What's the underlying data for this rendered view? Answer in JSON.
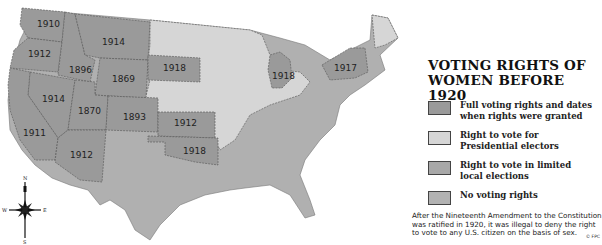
{
  "title_line1": "VOTING RIGHTS OF",
  "title_line2": "WOMEN BEFORE 1920",
  "legend": [
    {
      "label": "Full voting rights and dates when rights were granted",
      "color": "#9a9a9a"
    },
    {
      "label": "Right to vote for Presidential electors",
      "color": "#d6d6d6"
    },
    {
      "label": "Right to vote in limited local elections",
      "color": "#a8a8a8"
    },
    {
      "label": "No voting rights",
      "color": "#b2b2b2"
    }
  ],
  "note": "After the Nineteenth Amendment to the Constitution was ratified in 1920, it was illegal to deny the right to vote to any U.S. citizen on the basis of sex.",
  "credit": "© FPC",
  "compass": {
    "n": "N",
    "s": "S",
    "e": "E",
    "w": "W"
  },
  "states_full_rights": [
    {
      "state": "Washington",
      "year": "1910"
    },
    {
      "state": "Oregon",
      "year": "1912"
    },
    {
      "state": "Idaho",
      "year": "1896"
    },
    {
      "state": "Montana",
      "year": "1914"
    },
    {
      "state": "Wyoming",
      "year": "1869"
    },
    {
      "state": "South Dakota",
      "year": "1918"
    },
    {
      "state": "Nevada",
      "year": "1914"
    },
    {
      "state": "Utah",
      "year": "1870"
    },
    {
      "state": "Colorado",
      "year": "1893"
    },
    {
      "state": "California",
      "year": "1911"
    },
    {
      "state": "Arizona",
      "year": "1912"
    },
    {
      "state": "Kansas",
      "year": "1912"
    },
    {
      "state": "Oklahoma",
      "year": "1918"
    },
    {
      "state": "Michigan",
      "year": "1918"
    },
    {
      "state": "New York",
      "year": "1917"
    }
  ]
}
